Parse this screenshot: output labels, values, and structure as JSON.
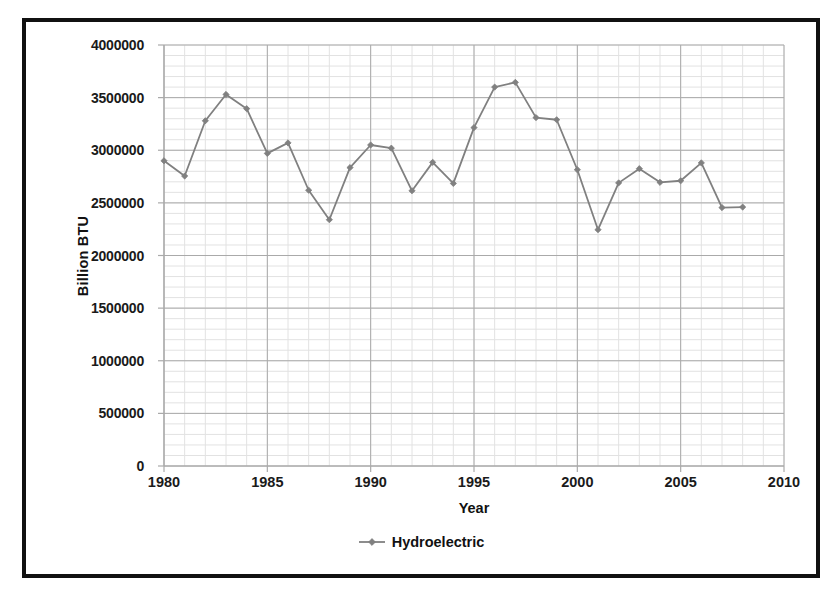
{
  "chart_data": {
    "type": "line",
    "title": "",
    "xlabel": "Year",
    "ylabel": "Billion BTU",
    "xlim": [
      1980,
      2010
    ],
    "ylim": [
      0,
      4000000
    ],
    "grid": true,
    "legend_position": "bottom",
    "x_ticks": [
      "1980",
      "1985",
      "1990",
      "1995",
      "2000",
      "2005",
      "2010"
    ],
    "x_tick_values": [
      1980,
      1985,
      1990,
      1995,
      2000,
      2005,
      2010
    ],
    "y_ticks": [
      "0",
      "500000",
      "1000000",
      "1500000",
      "2000000",
      "2500000",
      "3000000",
      "3500000",
      "4000000"
    ],
    "y_tick_values": [
      0,
      500000,
      1000000,
      1500000,
      2000000,
      2500000,
      3000000,
      3500000,
      4000000
    ],
    "series": [
      {
        "name": "Hydroelectric",
        "color": "#808080",
        "marker": "diamond",
        "x": [
          1980,
          1981,
          1982,
          1983,
          1984,
          1985,
          1986,
          1987,
          1988,
          1989,
          1990,
          1991,
          1992,
          1993,
          1994,
          1995,
          1996,
          1997,
          1998,
          1999,
          2000,
          2001,
          2002,
          2003,
          2004,
          2005,
          2006,
          2007,
          2008
        ],
        "values": [
          2900000,
          2755000,
          3280000,
          3530000,
          3395000,
          2970000,
          3070000,
          2620000,
          2340000,
          2835000,
          3050000,
          3020000,
          2615000,
          2885000,
          2685000,
          3215000,
          3600000,
          3645000,
          3310000,
          3290000,
          2815000,
          2245000,
          2690000,
          2825000,
          2695000,
          2710000,
          2880000,
          2455000,
          2460000
        ]
      }
    ]
  },
  "axes": {
    "x_title": "Year",
    "y_title": "Billion BTU"
  },
  "legend": {
    "entries": [
      {
        "label": "Hydroelectric",
        "color": "#808080"
      }
    ]
  },
  "colors": {
    "series": "#808080",
    "frame": "#111111",
    "major_grid": "#aaaaaa",
    "minor_grid": "#e2e2e2",
    "text": "#111111"
  }
}
